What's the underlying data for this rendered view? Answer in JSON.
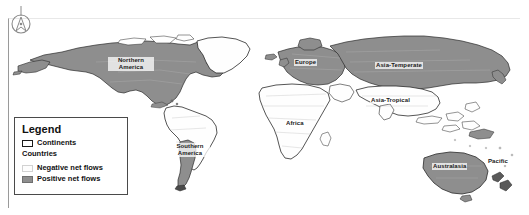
{
  "figure": {
    "type": "choropleth-world-map",
    "background_color": "#ffffff"
  },
  "compass": {
    "icon": "north-arrow-compass-icon",
    "label": "N"
  },
  "legend": {
    "title": "Legend",
    "countries_label": "Countries",
    "items": [
      {
        "label": "Continents",
        "swatch_color": "#ffffff",
        "swatch_border": "#1a1a1a"
      },
      {
        "label": "Negative net flows",
        "swatch_color": "#fdfdfd",
        "swatch_border": "#d2d2d2"
      },
      {
        "label": "Positive net flows",
        "swatch_color": "#8e8e8e",
        "swatch_border": "#6f6f6f"
      }
    ]
  },
  "map": {
    "labels": [
      {
        "id": "northern-america",
        "text": "Northern America"
      },
      {
        "id": "southern-america",
        "text": "Southern America"
      },
      {
        "id": "europe",
        "text": "Europe"
      },
      {
        "id": "africa",
        "text": "Africa"
      },
      {
        "id": "asia-temperate",
        "text": "Asia-Temperate"
      },
      {
        "id": "asia-tropical",
        "text": "Asia-Tropical"
      },
      {
        "id": "australasia",
        "text": "Australasia"
      },
      {
        "id": "pacific",
        "text": "Pacific"
      }
    ],
    "colors": {
      "positive_fill": "#8e8e8e",
      "negative_fill": "#fefefe",
      "outline": "#2a2a2a",
      "country_outline": "#b8b8b8",
      "ocean": "#ffffff"
    },
    "regions": [
      {
        "name": "Northern America",
        "net_flow": "positive"
      },
      {
        "name": "Greenland",
        "net_flow": "negative"
      },
      {
        "name": "Southern America",
        "net_flow": "negative"
      },
      {
        "name": "Southern Cone",
        "net_flow": "positive"
      },
      {
        "name": "Europe",
        "net_flow": "positive"
      },
      {
        "name": "Africa",
        "net_flow": "negative"
      },
      {
        "name": "Asia-Temperate",
        "net_flow": "positive"
      },
      {
        "name": "Asia-Tropical",
        "net_flow": "negative"
      },
      {
        "name": "Australasia",
        "net_flow": "positive"
      },
      {
        "name": "Pacific",
        "net_flow": "negative"
      }
    ]
  }
}
